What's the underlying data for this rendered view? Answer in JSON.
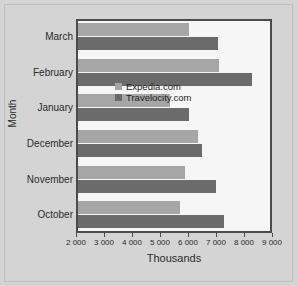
{
  "chart_data": {
    "type": "bar",
    "orientation": "horizontal",
    "title": "",
    "xlabel": "Thousands",
    "ylabel": "Month",
    "categories": [
      "March",
      "February",
      "January",
      "December",
      "November",
      "October"
    ],
    "series": [
      {
        "name": "Expedia.com",
        "color": "#a6a6a6",
        "values": [
          5980,
          7030,
          5290,
          6290,
          5820,
          5640
        ]
      },
      {
        "name": "Travelocity.com",
        "color": "#6b6b6b",
        "values": [
          7000,
          8210,
          5970,
          6430,
          6930,
          7210
        ]
      }
    ],
    "xlim": [
      2000,
      9000
    ],
    "xticks": [
      2000,
      3000,
      4000,
      5000,
      6000,
      7000,
      8000,
      9000
    ],
    "xticklabels": [
      "2 000",
      "3 000",
      "4 000",
      "5 000",
      "6 000",
      "7 000",
      "8 000",
      "9 000"
    ],
    "grid": false,
    "legend_position": "center-right",
    "plot_background": "#f6f6f6",
    "figure_background": "#d4d4d4",
    "axis_color": "#4b4b4b"
  }
}
